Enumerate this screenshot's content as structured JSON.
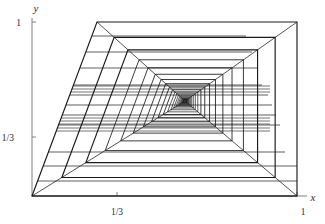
{
  "figure": {
    "name": "nested-rectangle-tunnel-orbit-diagram",
    "background_color": "#ffffff",
    "line_color": "#1a1a1a",
    "axis_color": "#808080",
    "axes": {
      "x": {
        "label": "x",
        "label_pos": [
          313,
          201
        ],
        "origin_px": [
          32,
          196
        ],
        "end_px": [
          307,
          196
        ],
        "ticks": [
          {
            "value": "1/3",
            "px": 117,
            "label_px": [
              117,
              215
            ]
          },
          {
            "value": "1",
            "px": 297,
            "label_px": [
              303,
              215
            ]
          }
        ]
      },
      "y": {
        "label": "y",
        "label_pos": [
          36,
          12
        ],
        "origin_px": [
          32,
          196
        ],
        "end_px": [
          32,
          18
        ],
        "ticks": [
          {
            "value": "1",
            "px": 22,
            "label_px": [
              21,
              26
            ]
          },
          {
            "value": "1/3",
            "px": 137,
            "label_px": [
              14,
              141
            ]
          }
        ]
      }
    }
  },
  "chart_data": {
    "type": "line",
    "title": "",
    "xlabel": "x",
    "ylabel": "y",
    "xlim": [
      0,
      1.04
    ],
    "ylim": [
      0,
      1.04
    ],
    "grid": false,
    "legend": "none",
    "xticks": [
      "1/3",
      "1"
    ],
    "yticks": [
      "1/3",
      "1"
    ],
    "vanishing_point_px": [
      185,
      101
    ],
    "outer_quad_px": [
      [
        97,
        22
      ],
      [
        297,
        22
      ],
      [
        297,
        196
      ],
      [
        32,
        196
      ]
    ],
    "ring_count": 22,
    "ring_shrink_ratio": 0.805,
    "extra_horizontal_lines_px": [
      [
        32,
        196,
        297,
        196
      ],
      [
        43,
        166,
        297,
        166
      ],
      [
        38,
        181,
        297,
        181
      ],
      [
        48,
        152,
        285,
        152
      ],
      [
        58,
        125,
        280,
        125
      ],
      [
        62,
        115,
        276,
        115
      ],
      [
        66,
        105,
        272,
        105
      ],
      [
        70,
        95,
        268,
        95
      ],
      [
        74,
        85,
        262,
        85
      ],
      [
        80,
        68,
        258,
        68
      ],
      [
        86,
        52,
        252,
        52
      ],
      [
        92,
        36,
        246,
        36
      ]
    ]
  }
}
